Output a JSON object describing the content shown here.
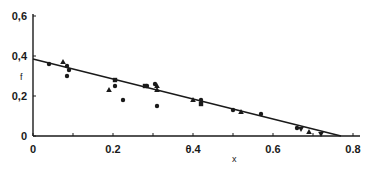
{
  "chart_data": {
    "type": "scatter",
    "title": "",
    "xlabel": "x",
    "ylabel": "f",
    "xlim": [
      0,
      0.8
    ],
    "ylim": [
      0,
      0.6
    ],
    "x_ticks": [
      "0",
      "0.2",
      "θ.4",
      "0.6",
      "0.8"
    ],
    "x_tick_values": [
      0,
      0.2,
      0.4,
      0.6,
      0.8
    ],
    "x_minor_ticks": [
      0.1,
      0.3,
      0.5,
      0.7
    ],
    "y_ticks": [
      "0",
      "0,2",
      "0,4",
      "0,6"
    ],
    "y_tick_values": [
      0,
      0.2,
      0.4,
      0.6
    ],
    "grid": false,
    "legend": null,
    "series": [
      {
        "name": "circles",
        "marker": "circle",
        "points": [
          [
            0.04,
            0.36
          ],
          [
            0.085,
            0.35
          ],
          [
            0.09,
            0.33
          ],
          [
            0.085,
            0.3
          ],
          [
            0.205,
            0.25
          ],
          [
            0.225,
            0.18
          ],
          [
            0.285,
            0.25
          ],
          [
            0.305,
            0.26
          ],
          [
            0.31,
            0.15
          ],
          [
            0.42,
            0.18
          ],
          [
            0.5,
            0.13
          ],
          [
            0.57,
            0.11
          ],
          [
            0.66,
            0.04
          ]
        ]
      },
      {
        "name": "triangles",
        "marker": "triangle",
        "points": [
          [
            0.075,
            0.37
          ],
          [
            0.19,
            0.23
          ],
          [
            0.31,
            0.25
          ],
          [
            0.31,
            0.23
          ],
          [
            0.4,
            0.18
          ],
          [
            0.52,
            0.12
          ],
          [
            0.69,
            0.02
          ]
        ]
      },
      {
        "name": "squares",
        "marker": "square",
        "points": [
          [
            0.205,
            0.28
          ],
          [
            0.28,
            0.25
          ],
          [
            0.42,
            0.16
          ]
        ]
      },
      {
        "name": "inverted-triangles",
        "marker": "triangle-down",
        "points": [
          [
            0.67,
            0.035
          ],
          [
            0.72,
            0.01
          ]
        ]
      }
    ],
    "fit_line": {
      "x": [
        0,
        0.77
      ],
      "y": [
        0.385,
        0
      ]
    }
  },
  "colors": {
    "ink": "#1a1a1a",
    "background": "#ffffff"
  }
}
